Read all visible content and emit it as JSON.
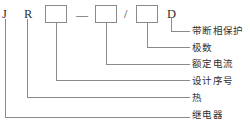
{
  "diagram": {
    "line_color": "#8a8a8a",
    "text_color": "#2f2f2f",
    "background": "#ffffff",
    "code_items": [
      {
        "name": "code-letter-j",
        "text": "J",
        "type": "letter",
        "x": 2,
        "y": 8
      },
      {
        "name": "code-letter-r",
        "text": "R",
        "type": "letter",
        "x": 24,
        "y": 8
      },
      {
        "name": "code-box-1",
        "text": "",
        "type": "box",
        "x": 45,
        "y": 5
      },
      {
        "name": "code-dash",
        "text": "—",
        "type": "separator",
        "x": 76,
        "y": 9
      },
      {
        "name": "code-box-2",
        "text": "",
        "type": "box",
        "x": 95,
        "y": 5
      },
      {
        "name": "code-slash",
        "text": "/",
        "type": "separator",
        "x": 124,
        "y": 8
      },
      {
        "name": "code-box-3",
        "text": "",
        "type": "box",
        "x": 136,
        "y": 5
      },
      {
        "name": "code-letter-d",
        "text": "D",
        "type": "letter",
        "x": 167,
        "y": 8
      }
    ],
    "labels": [
      {
        "name": "label-phase-failure-protection",
        "text": "带断相保护",
        "x": 192,
        "y": 26
      },
      {
        "name": "label-pole-count",
        "text": "极数",
        "x": 192,
        "y": 43
      },
      {
        "name": "label-rated-current",
        "text": "额定电流",
        "x": 192,
        "y": 59
      },
      {
        "name": "label-design-serial-number",
        "text": "设计序号",
        "x": 192,
        "y": 76
      },
      {
        "name": "label-thermal",
        "text": "热",
        "x": 192,
        "y": 93
      },
      {
        "name": "label-relay",
        "text": "继电器",
        "x": 192,
        "y": 110
      }
    ],
    "leaders": [
      {
        "name": "leader-phase-failure-protection",
        "from": "code-letter-d",
        "path": "M 171,18 L 171,31 L 189,31"
      },
      {
        "name": "leader-pole-count",
        "path": "M 147,23 L 147,47.5 L 189,47.5"
      },
      {
        "name": "leader-rated-current",
        "path": "M 106,23 L 106,64 L 189,64"
      },
      {
        "name": "leader-design-serial-number",
        "path": "M 56,23 L 56,80.5 L 189,80.5"
      },
      {
        "name": "leader-thermal",
        "path": "M 27,19 L 27,97.5 L 189,97.5"
      },
      {
        "name": "leader-relay",
        "path": "M 5,19 L 5,117 L 189,117"
      }
    ]
  }
}
